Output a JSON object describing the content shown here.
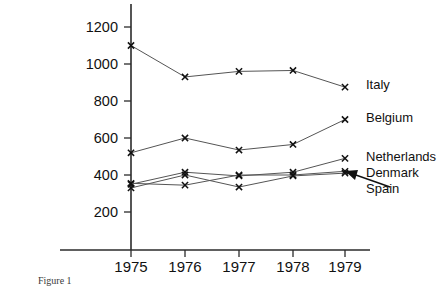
{
  "chart_data": {
    "type": "line",
    "title": "",
    "xlabel": "",
    "ylabel": "",
    "categories": [
      "1975",
      "1976",
      "1977",
      "1978",
      "1979"
    ],
    "ylim": [
      0,
      1280
    ],
    "yticks": [
      200,
      400,
      600,
      800,
      1000,
      1200
    ],
    "ytick_labels": [
      "200",
      "400",
      "600",
      "800",
      "1000",
      "1200"
    ],
    "grid": false,
    "legend_position": "right",
    "marker": "x",
    "series": [
      {
        "name": "Italy",
        "values": [
          1100,
          930,
          960,
          965,
          875
        ]
      },
      {
        "name": "Belgium",
        "values": [
          520,
          600,
          535,
          565,
          700
        ]
      },
      {
        "name": "Netherlands",
        "values": [
          350,
          415,
          395,
          415,
          490
        ]
      },
      {
        "name": "Denmark",
        "values": [
          355,
          345,
          400,
          400,
          420
        ]
      },
      {
        "name": "Spain",
        "values": [
          330,
          400,
          335,
          395,
          410
        ]
      }
    ],
    "annotations": [
      {
        "text": "Spain",
        "target_series": "Spain",
        "target_x": "1979",
        "style": "arrow"
      }
    ]
  },
  "legend": {
    "items": [
      {
        "label": "Italy"
      },
      {
        "label": "Belgium"
      },
      {
        "label": "Netherlands"
      },
      {
        "label": "Denmark"
      },
      {
        "label": "Spain"
      }
    ]
  },
  "caption": {
    "text": "Figure 1"
  }
}
